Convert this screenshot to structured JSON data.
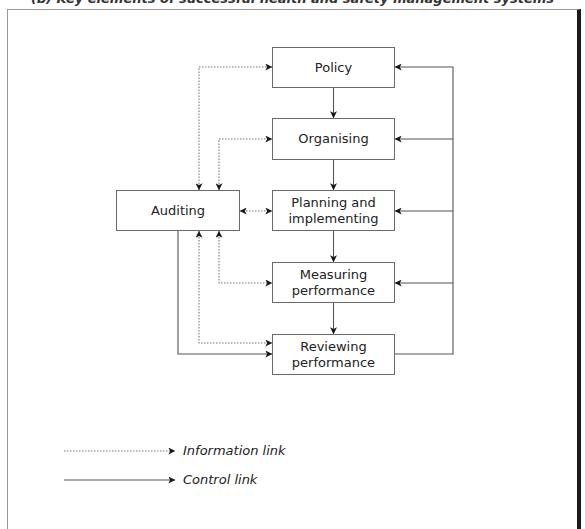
{
  "figure": {
    "title": "(b) Key elements of successful health and safety management systems"
  },
  "nodes": [
    {
      "id": "policy",
      "lines": [
        "Policy"
      ],
      "x": 272,
      "y": 47,
      "w": 123,
      "h": 41
    },
    {
      "id": "organising",
      "lines": [
        "Organising"
      ],
      "x": 272,
      "y": 118,
      "w": 123,
      "h": 42
    },
    {
      "id": "planning",
      "lines": [
        "Planning and",
        "implementing"
      ],
      "x": 272,
      "y": 190,
      "w": 123,
      "h": 41
    },
    {
      "id": "measuring",
      "lines": [
        "Measuring",
        "performance"
      ],
      "x": 272,
      "y": 262,
      "w": 123,
      "h": 41
    },
    {
      "id": "reviewing",
      "lines": [
        "Reviewing",
        "performance"
      ],
      "x": 272,
      "y": 334,
      "w": 123,
      "h": 41
    },
    {
      "id": "auditing",
      "lines": [
        "Auditing"
      ],
      "x": 116,
      "y": 190,
      "w": 124,
      "h": 41
    }
  ],
  "edges": [
    {
      "from": "policy",
      "to": "organising",
      "type": "control",
      "path": "M333.5,88 L333.5,118",
      "arrow_end": true,
      "arrow_start": false
    },
    {
      "from": "organising",
      "to": "planning",
      "type": "control",
      "path": "M333.5,160 L333.5,190",
      "arrow_end": true,
      "arrow_start": false
    },
    {
      "from": "planning",
      "to": "measuring",
      "type": "control",
      "path": "M333.5,231 L333.5,262",
      "arrow_end": true,
      "arrow_start": false
    },
    {
      "from": "measuring",
      "to": "reviewing",
      "type": "control",
      "path": "M333.5,303 L333.5,334",
      "arrow_end": true,
      "arrow_start": false
    },
    {
      "from": "reviewing",
      "to": "policy",
      "type": "control",
      "path": "M395,354 L453,354 L453,67 L395,67",
      "arrow_end": true,
      "arrow_start": false
    },
    {
      "from": "reviewing",
      "to": "organising",
      "type": "control",
      "path": "M453,139 L395,139",
      "arrow_end": true,
      "arrow_start": false
    },
    {
      "from": "reviewing",
      "to": "planning",
      "type": "control",
      "path": "M453,211 L395,211",
      "arrow_end": true,
      "arrow_start": false
    },
    {
      "from": "reviewing",
      "to": "measuring",
      "type": "control",
      "path": "M453,283 L395,283",
      "arrow_end": true,
      "arrow_start": false
    },
    {
      "from": "auditing",
      "to": "reviewing",
      "type": "control",
      "path": "M178,231 L178,354 L272,354",
      "arrow_end": true,
      "arrow_start": false
    },
    {
      "from": "auditing",
      "to": "policy",
      "type": "information",
      "path": "M199,190 L199,67 L272,67",
      "arrow_end": true,
      "arrow_start": true
    },
    {
      "from": "auditing",
      "to": "organising",
      "type": "information",
      "path": "M219,190 L219,139 L272,139",
      "arrow_end": true,
      "arrow_start": true
    },
    {
      "from": "auditing",
      "to": "planning",
      "type": "information",
      "path": "M240,211 L272,211",
      "arrow_end": true,
      "arrow_start": true
    },
    {
      "from": "auditing",
      "to": "measuring",
      "type": "information",
      "path": "M219,231 L219,283 L272,283",
      "arrow_end": true,
      "arrow_start": true
    },
    {
      "from": "auditing",
      "to": "reviewing",
      "type": "information",
      "path": "M199,231 L199,343 L272,343",
      "arrow_end": true,
      "arrow_start": true
    }
  ],
  "legend": {
    "items": [
      {
        "type": "information",
        "label": "Information link",
        "line": "M64,451 L175,451",
        "text_x": 183,
        "text_y": 443
      },
      {
        "type": "control",
        "label": "Control link",
        "line": "M64,480 L175,480",
        "text_x": 183,
        "text_y": 472
      }
    ]
  },
  "styles": {
    "control_color": "#555555",
    "information_color": "#777777",
    "arrow_color": "#1a1a1a",
    "box_border": "#6a6a6a",
    "frame_right": "#1a1a1a"
  }
}
